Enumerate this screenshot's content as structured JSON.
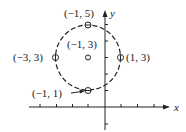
{
  "diagram": {
    "type": "circle-on-coordinate-plane",
    "axes": {
      "x_label": "x",
      "y_label": "y"
    },
    "circle": {
      "center": [
        -1,
        3
      ],
      "radius": 2,
      "style": "dashed"
    },
    "points": [
      {
        "label": "(−1, 5)",
        "coords": [
          -1,
          5
        ],
        "marker": "circle-dash"
      },
      {
        "label": "(−1, 3)",
        "coords": [
          -1,
          3
        ],
        "marker": "open-circle"
      },
      {
        "label": "(−3, 3)",
        "coords": [
          -3,
          3
        ],
        "marker": "circle-bar"
      },
      {
        "label": "(1, 3)",
        "coords": [
          1,
          3
        ],
        "marker": "circle-bar"
      },
      {
        "label": "(−1, 1)",
        "coords": [
          -1,
          1
        ],
        "marker": "circle-dash"
      }
    ],
    "colors": {
      "ink": "#222222",
      "background": "#ffffff"
    }
  }
}
